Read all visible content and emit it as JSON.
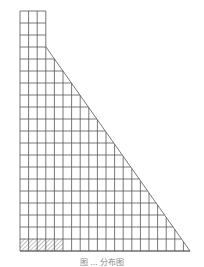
{
  "diagram": {
    "grid": {
      "left": 20,
      "top": 11,
      "col_width": 8.6,
      "row_height": 12,
      "total_cols": 19,
      "total_rows": 20,
      "tall_column_cols": 3,
      "step_row": 3
    },
    "diagonal": {
      "x1": 46,
      "y1": 47,
      "x2": 190,
      "y2": 251
    },
    "hatched_cells": {
      "row": 19,
      "cols": [
        0,
        1,
        2,
        3,
        4
      ]
    },
    "colors": {
      "line": "#555555",
      "hatch": "#999999",
      "background": "#ffffff"
    }
  },
  "caption": "图 ... 分布图"
}
